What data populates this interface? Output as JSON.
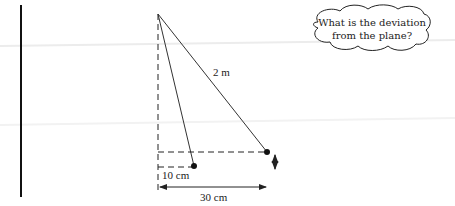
{
  "diagram": {
    "type": "pendulum-deviation",
    "labels": {
      "string_length": "2 m",
      "small_offset": "10 cm",
      "large_offset": "30 cm"
    },
    "thought_bubble": {
      "line1": "What is the deviation",
      "line2": "from the plane?"
    },
    "colors": {
      "line": "#222222",
      "wall": "#111111",
      "background": "#ffffff"
    }
  }
}
